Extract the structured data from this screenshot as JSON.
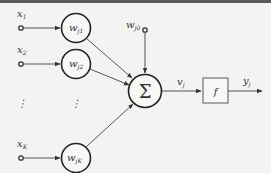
{
  "diagram": {
    "inputs": [
      {
        "label": "x",
        "sub": "1"
      },
      {
        "label": "x",
        "sub": "2"
      },
      {
        "label": "x",
        "sub": "K"
      }
    ],
    "ellipsis": "⋮",
    "weights": [
      {
        "label": "w",
        "sub": "j1"
      },
      {
        "label": "w",
        "sub": "j2"
      },
      {
        "label": "w",
        "sub": "jK"
      }
    ],
    "bias": {
      "label": "w",
      "sub": "j0"
    },
    "summation": {
      "symbol": "Σ"
    },
    "net_output": {
      "label": "v",
      "sub": "j"
    },
    "activation": {
      "label": "f"
    },
    "output": {
      "label": "y",
      "sub": "j"
    },
    "colors": {
      "stroke": "#333333",
      "background": "#f3f3f1",
      "box_stroke": "#666666"
    }
  }
}
